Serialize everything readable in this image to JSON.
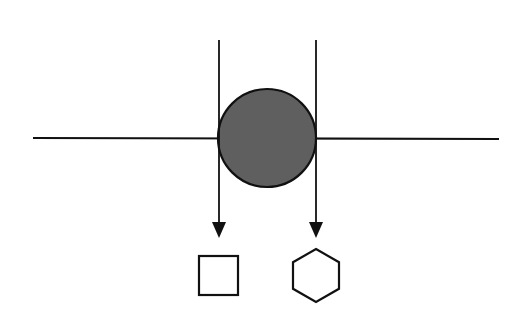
{
  "diagram": {
    "background": "#ffffff",
    "stroke_color": "#111111",
    "horizontal_line": {
      "x1": 33,
      "y1": 138,
      "x2": 499,
      "y2": 139
    },
    "circle": {
      "cx": 267,
      "cy": 138,
      "r": 49,
      "fill": "#5f5f5f"
    },
    "arrows": [
      {
        "id": "left-arrow",
        "x": 219,
        "y_start": 40,
        "y_end": 238,
        "target": "square"
      },
      {
        "id": "right-arrow",
        "x": 316,
        "y_start": 40,
        "y_end": 238,
        "target": "hexagon"
      }
    ],
    "square": {
      "x": 199,
      "y": 256,
      "width": 39,
      "height": 39,
      "fill": "#ffffff"
    },
    "hexagon": {
      "cx": 316,
      "cy": 275.5,
      "rx": 23,
      "ry": 26.5,
      "fill": "#ffffff"
    }
  }
}
